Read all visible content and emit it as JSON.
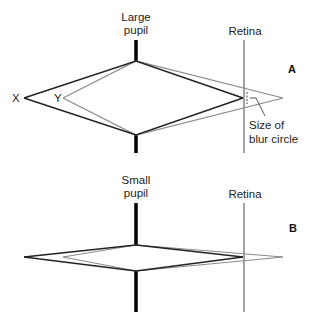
{
  "panels": [
    {
      "id": "A",
      "tag": "A",
      "pupil_label_line1": "Large",
      "pupil_label_line2": "pupil",
      "retina_label": "Retina",
      "point_x_label": "X",
      "point_y_label": "Y",
      "annotation_line1": "Size of",
      "annotation_line2": "blur circle"
    },
    {
      "id": "B",
      "tag": "B",
      "pupil_label_line1": "Small",
      "pupil_label_line2": "pupil",
      "retina_label": "Retina"
    }
  ],
  "colors": {
    "in_focus_rays": "#222222",
    "out_of_focus_rays": "#8a8a8a",
    "retina": "#666666",
    "pupil": "#000000"
  }
}
